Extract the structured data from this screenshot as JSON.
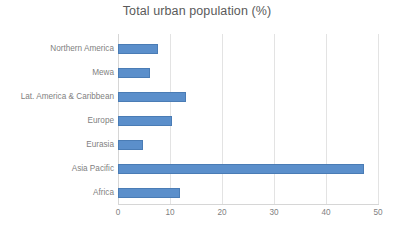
{
  "chart_data": {
    "type": "bar",
    "orientation": "horizontal",
    "title": "Total urban population (%)",
    "xlabel": "",
    "ylabel": "",
    "categories": [
      "Northern America",
      "Mewa",
      "Lat. America & Caribbean",
      "Europe",
      "Eurasia",
      "Asia Pacific",
      "Africa"
    ],
    "values": [
      7.7,
      6.2,
      13.1,
      10.4,
      4.9,
      47.3,
      11.9
    ],
    "xlim": [
      0,
      50
    ],
    "xticks": [
      "0",
      "10",
      "20",
      "30",
      "40",
      "50"
    ],
    "xtick_values": [
      0,
      10,
      20,
      30,
      40,
      50
    ],
    "grid": "vertical",
    "legend": "none",
    "series": [
      {
        "name": "Total urban population (%)",
        "color": "#5b8fcb",
        "values": [
          7.7,
          6.2,
          13.1,
          10.4,
          4.9,
          47.3,
          11.9
        ]
      }
    ]
  },
  "colors": {
    "bar_fill": "#5b8fcb",
    "bar_stroke": "#4a7cb5",
    "gridline": "#e3e3e3",
    "axis": "#d6d6d6",
    "title_text": "#5a5a5a",
    "label_text": "#7f7f7f",
    "background": "#ffffff"
  }
}
